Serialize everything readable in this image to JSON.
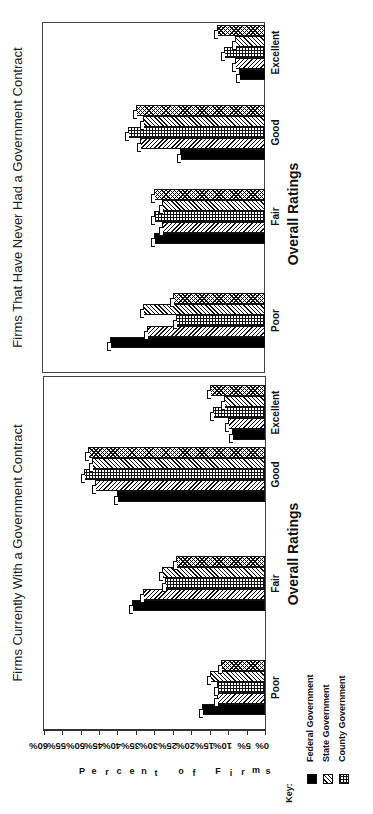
{
  "chart_data": {
    "type": "bar",
    "orientation": "rotated-90-ccw",
    "ylabel": "Percent of Firms",
    "xlabel": "Overall Ratings",
    "yticks": [
      "0%",
      "5%",
      "10%",
      "15%",
      "20%",
      "25%",
      "30%",
      "35%",
      "40%",
      "45%",
      "50%",
      "55%",
      "60%"
    ],
    "ylim": [
      0,
      60
    ],
    "categories": [
      "Poor",
      "Fair",
      "Good",
      "Excellent"
    ],
    "legend_title": "Key:",
    "legend_visible": [
      "Federal Government",
      "State Government",
      "County Government"
    ],
    "series_patterns": [
      "solid",
      "back-diagonal",
      "grid",
      "forward-diagonal",
      "crosshatch"
    ],
    "panels": [
      {
        "title": "Firms Currently With a Government Contract",
        "series": [
          {
            "name": "Federal Government",
            "values": [
              17,
              36,
              40,
              9
            ]
          },
          {
            "name": "State Government",
            "values": [
              13,
              33,
              46,
              10
            ]
          },
          {
            "name": "County Government",
            "values": [
              13,
              27,
              49,
              14
            ]
          },
          {
            "name": "Series 4 (legend not visible)",
            "values": [
              15,
              28,
              47,
              11
            ]
          },
          {
            "name": "Series 5 (legend not visible)",
            "values": [
              12,
              24,
              48,
              15
            ]
          }
        ]
      },
      {
        "title": "Firms That Have Never Had a Government Contract",
        "series": [
          {
            "name": "Federal Government",
            "values": [
              42,
              30,
              23,
              7
            ]
          },
          {
            "name": "State Government",
            "values": [
              32,
              28,
              34,
              8
            ]
          },
          {
            "name": "County Government",
            "values": [
              24,
              30,
              37,
              11
            ]
          },
          {
            "name": "Series 4 (legend not visible)",
            "values": [
              33,
              28,
              33,
              8
            ]
          },
          {
            "name": "Series 5 (legend not visible)",
            "values": [
              25,
              30,
              35,
              13
            ]
          }
        ]
      }
    ]
  },
  "labels": {
    "panel_currently_title": "Firms Currently With a Government Contract",
    "panel_never_title": "Firms That Have Never Had a Government Contract",
    "xaxis_title_currently": "Overall Ratings",
    "xaxis_title_never": "Overall Ratings",
    "ylabel": "Percent of Firms",
    "key_title": "Key:",
    "legend": [
      {
        "label": "Federal Government",
        "pattern": "solid"
      },
      {
        "label": "State Government",
        "pattern": "back-diagonal"
      },
      {
        "label": "County Government",
        "pattern": "grid"
      }
    ]
  }
}
